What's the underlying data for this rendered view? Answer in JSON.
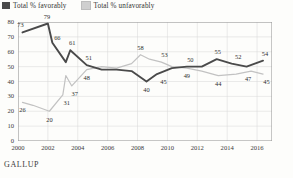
{
  "brand": "GALLUP",
  "legend": {
    "position": "top-left",
    "items": [
      {
        "label": "Total % favorably",
        "color": "#4a4a4a",
        "key": "favorable"
      },
      {
        "label": "Total % unfavorably",
        "color": "#cfcfcf",
        "key": "unfavorable"
      }
    ]
  },
  "chart_data": {
    "type": "line",
    "title": "",
    "subtitle": "",
    "xlabel": "",
    "ylabel": "",
    "grid": true,
    "xlim": [
      2000,
      2017
    ],
    "ylim": [
      0,
      80
    ],
    "yticks": [
      0,
      10,
      20,
      30,
      40,
      50,
      60,
      70,
      80
    ],
    "ytick_labels": [
      "0",
      "10",
      "20",
      "30",
      "40",
      "50",
      "60",
      "70",
      "80"
    ],
    "xticks": [
      2000,
      2002,
      2004,
      2006,
      2008,
      2010,
      2012,
      2014,
      2016
    ],
    "xtick_labels": [
      "2000",
      "2002",
      "2004",
      "2006",
      "2008",
      "2010",
      "2012",
      "2014",
      "2016"
    ],
    "legend_position": "top-left",
    "series": [
      {
        "name": "Total % favorably",
        "color": "#4a4a4a",
        "x": [
          2000.3,
          2002.0,
          2002.3,
          2003.2,
          2003.5,
          2004.6,
          2005.6,
          2006.6,
          2007.6,
          2008.6,
          2009.3,
          2010.3,
          2011.3,
          2012.3,
          2013.3,
          2014.3,
          2015.3,
          2016.4
        ],
        "values": [
          73,
          79,
          66,
          53,
          61,
          51,
          48,
          48,
          47,
          40,
          45,
          49,
          50,
          50,
          55,
          52,
          50,
          54
        ],
        "labels": [
          {
            "x": 2000.3,
            "y": 73,
            "text": "73",
            "dx": -2,
            "dy": -7
          },
          {
            "x": 2002.0,
            "y": 79,
            "text": "79",
            "dx": -1,
            "dy": -7
          },
          {
            "x": 2002.3,
            "y": 66,
            "text": "66",
            "dx": 5,
            "dy": -5
          },
          {
            "x": 2003.5,
            "y": 61,
            "text": "61",
            "dx": 2,
            "dy": -7
          },
          {
            "x": 2004.6,
            "y": 51,
            "text": "51",
            "dx": 2,
            "dy": -7
          },
          {
            "x": 2008.6,
            "y": 40,
            "text": "40",
            "dx": 0,
            "dy": 8
          },
          {
            "x": 2009.6,
            "y": 45,
            "text": "45",
            "dx": 2,
            "dy": 8
          },
          {
            "x": 2011.4,
            "y": 50,
            "text": "50",
            "dx": 2,
            "dy": -7
          },
          {
            "x": 2013.3,
            "y": 55,
            "text": "55",
            "dx": 1,
            "dy": -7
          },
          {
            "x": 2014.6,
            "y": 52,
            "text": "52",
            "dx": 2,
            "dy": -7
          },
          {
            "x": 2016.4,
            "y": 54,
            "text": "54",
            "dx": 2,
            "dy": -7
          }
        ]
      },
      {
        "name": "Total % unfavorably",
        "color": "#c2c2c2",
        "x": [
          2000.3,
          2001.0,
          2002.1,
          2003.0,
          2003.2,
          2003.6,
          2004.6,
          2005.6,
          2006.6,
          2007.6,
          2008.2,
          2008.8,
          2009.6,
          2010.3,
          2011.3,
          2012.3,
          2013.4,
          2014.6,
          2015.6,
          2016.4
        ],
        "values": [
          26,
          24,
          20,
          31,
          44,
          37,
          48,
          50,
          49,
          52,
          58,
          55,
          53,
          50,
          49,
          47,
          44,
          45,
          47,
          45
        ],
        "labels": [
          {
            "x": 2000.3,
            "y": 26,
            "text": "26",
            "dx": 0,
            "dy": 8
          },
          {
            "x": 2002.1,
            "y": 20,
            "text": "20",
            "dx": 0,
            "dy": 9
          },
          {
            "x": 2003.0,
            "y": 31,
            "text": "31",
            "dx": 4,
            "dy": 8
          },
          {
            "x": 2003.6,
            "y": 37,
            "text": "37",
            "dx": 3,
            "dy": 8
          },
          {
            "x": 2004.6,
            "y": 48,
            "text": "48",
            "dx": 0,
            "dy": 8
          },
          {
            "x": 2008.2,
            "y": 58,
            "text": "58",
            "dx": 0,
            "dy": -7
          },
          {
            "x": 2009.8,
            "y": 53,
            "text": "53",
            "dx": 0,
            "dy": -7
          },
          {
            "x": 2011.3,
            "y": 49,
            "text": "49",
            "dx": 0,
            "dy": 8
          },
          {
            "x": 2013.4,
            "y": 44,
            "text": "44",
            "dx": 0,
            "dy": 8
          },
          {
            "x": 2015.4,
            "y": 47,
            "text": "47",
            "dx": 0,
            "dy": 8
          },
          {
            "x": 2016.5,
            "y": 45,
            "text": "45",
            "dx": 2,
            "dy": 8
          }
        ]
      }
    ]
  }
}
